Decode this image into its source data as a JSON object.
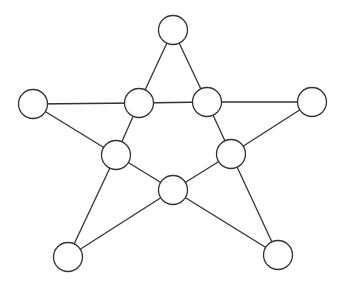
{
  "diagram": {
    "type": "graph",
    "style": {
      "stroke": "#333333",
      "fill": "#ffffff",
      "background": "#ffffff",
      "node_radius": 14.5
    },
    "nodes": [
      {
        "id": "top",
        "x": 173,
        "y": 30
      },
      {
        "id": "left",
        "x": 33,
        "y": 104
      },
      {
        "id": "inner-left",
        "x": 139,
        "y": 103
      },
      {
        "id": "inner-right",
        "x": 207,
        "y": 102
      },
      {
        "id": "right",
        "x": 312,
        "y": 102
      },
      {
        "id": "inner-lower-left",
        "x": 116,
        "y": 155
      },
      {
        "id": "inner-lower-right",
        "x": 231,
        "y": 154
      },
      {
        "id": "center-bottom",
        "x": 173,
        "y": 190
      },
      {
        "id": "bottom-left",
        "x": 68,
        "y": 257
      },
      {
        "id": "bottom-right",
        "x": 278,
        "y": 255
      }
    ],
    "edges": [
      [
        "top",
        "inner-left"
      ],
      [
        "top",
        "inner-right"
      ],
      [
        "left",
        "inner-left"
      ],
      [
        "inner-left",
        "inner-right"
      ],
      [
        "inner-right",
        "right"
      ],
      [
        "left",
        "inner-lower-left"
      ],
      [
        "right",
        "inner-lower-right"
      ],
      [
        "inner-left",
        "inner-lower-left"
      ],
      [
        "inner-right",
        "inner-lower-right"
      ],
      [
        "inner-lower-left",
        "center-bottom"
      ],
      [
        "inner-lower-right",
        "center-bottom"
      ],
      [
        "inner-lower-left",
        "bottom-left"
      ],
      [
        "inner-lower-right",
        "bottom-right"
      ],
      [
        "center-bottom",
        "bottom-left"
      ],
      [
        "center-bottom",
        "bottom-right"
      ]
    ]
  }
}
